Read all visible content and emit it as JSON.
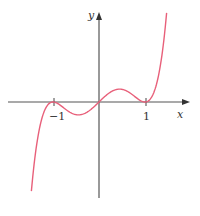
{
  "chart_data": {
    "type": "line",
    "title": "",
    "xlabel": "x",
    "ylabel": "y",
    "x_ticks": [
      {
        "value": -1,
        "label": "-1"
      },
      {
        "value": 1,
        "label": "1"
      }
    ],
    "xlim": [
      -2.1,
      1.95
    ],
    "ylim": [
      -2.1,
      2.0
    ],
    "grid": false,
    "series": [
      {
        "name": "f(x)",
        "color": "#e8607a",
        "x": [
          -1.47,
          -1.3,
          -1.1,
          -1.0,
          -0.8,
          -0.6,
          -0.447,
          -0.3,
          -0.15,
          0,
          0.15,
          0.3,
          0.447,
          0.6,
          0.8,
          1.0,
          1.1,
          1.3,
          1.47
        ],
        "y": [
          -1.73,
          -0.63,
          -0.05,
          0,
          -0.1,
          -0.25,
          -0.29,
          -0.25,
          -0.14,
          0,
          0.14,
          0.25,
          0.29,
          0.25,
          0.1,
          0,
          0.05,
          0.63,
          1.73
        ]
      }
    ],
    "annotations": [
      "Double roots at x = -1 and x = 1, crossing at origin"
    ]
  },
  "labels": {
    "x_axis": "x",
    "y_axis": "y",
    "tick_neg1": "−1",
    "tick_pos1": "1"
  }
}
